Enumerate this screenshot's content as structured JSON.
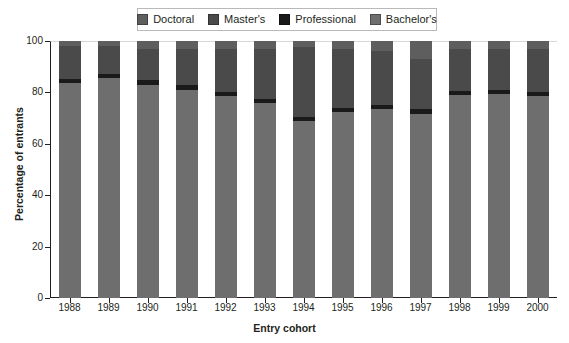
{
  "chart_data": {
    "type": "bar",
    "subtype": "stacked-bar-100",
    "title": "",
    "xlabel": "Entry cohort",
    "ylabel": "Percentage of entrants",
    "categories": [
      "1988",
      "1989",
      "1990",
      "1991",
      "1992",
      "1993",
      "1994",
      "1995",
      "1996",
      "1997",
      "1998",
      "1999",
      "2000"
    ],
    "ylim": [
      0,
      100
    ],
    "yticks": [
      0,
      20,
      40,
      60,
      80,
      100
    ],
    "ytick_labels": [
      "0",
      "20",
      "40",
      "60",
      "80",
      "100"
    ],
    "grid": false,
    "legend_position": "top-center",
    "stack_order_bottom_to_top": [
      "Bachelor's",
      "Professional",
      "Master's",
      "Doctoral"
    ],
    "series": [
      {
        "name": "Bachelor's",
        "color": "#6e6e6e",
        "values": [
          83.5,
          85.5,
          83.0,
          81.0,
          78.5,
          76.0,
          69.0,
          72.5,
          73.5,
          71.5,
          79.0,
          79.5,
          78.5
        ]
      },
      {
        "name": "Professional",
        "color": "#1a1a1a",
        "values": [
          1.8,
          1.8,
          2.0,
          2.0,
          1.6,
          1.5,
          1.5,
          1.5,
          1.5,
          2.0,
          1.6,
          1.5,
          1.5
        ]
      },
      {
        "name": "Master's",
        "color": "#4a4a4a",
        "values": [
          12.7,
          10.7,
          12.0,
          14.0,
          16.9,
          19.5,
          27.0,
          23.0,
          21.0,
          19.5,
          16.4,
          16.0,
          17.0
        ]
      },
      {
        "name": "Doctoral",
        "color": "#5e5e5e",
        "values": [
          2.0,
          2.0,
          3.0,
          3.0,
          3.0,
          3.0,
          2.5,
          3.0,
          4.0,
          7.0,
          3.0,
          3.0,
          3.0
        ]
      }
    ]
  },
  "legend": {
    "items": [
      {
        "label": "Doctoral",
        "color": "#5e5e5e"
      },
      {
        "label": "Master's",
        "color": "#4a4a4a"
      },
      {
        "label": "Professional",
        "color": "#1a1a1a"
      },
      {
        "label": "Bachelor's",
        "color": "#6e6e6e"
      }
    ]
  },
  "axes": {
    "y_title": "Percentage of entrants",
    "x_title": "Entry cohort"
  }
}
